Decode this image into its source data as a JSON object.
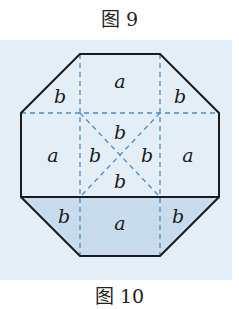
{
  "figure_top": {
    "caption": "图 9"
  },
  "figure_bottom": {
    "caption": "图 10"
  },
  "diagram": {
    "shape": "octagon",
    "labels": {
      "top_left": "b",
      "top_middle": "a",
      "top_right": "b",
      "mid_left": "a",
      "center_top": "b",
      "center_left": "b",
      "center_right": "b",
      "center_bottom": "b",
      "mid_right": "a",
      "bottom_left": "b",
      "bottom_middle": "a",
      "bottom_right": "b"
    },
    "colors": {
      "background": "#e4eef6",
      "shaded": "#c9dcee",
      "outline": "#1a1a1a",
      "dashed": "#4a8ac4"
    }
  }
}
